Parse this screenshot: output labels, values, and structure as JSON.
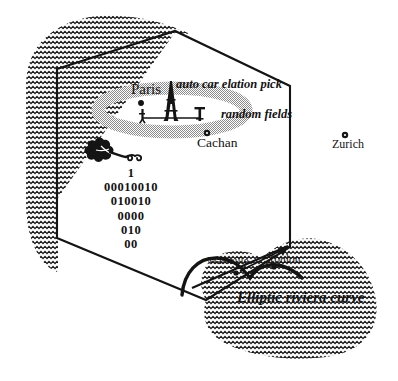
{
  "figure": {
    "kind": "hand-drawn-map-diagram",
    "background_color": "#ffffff",
    "ink_color": "#121212",
    "shade_color": "#9a9a9a"
  },
  "region": {
    "name": "hexagon-outline",
    "description": "France hexagon boundary"
  },
  "coastline": {
    "name": "wavy-hatched-coast",
    "pattern": "zigzag-wave-hatch"
  },
  "cities": [
    {
      "id": "paris",
      "label": "Paris",
      "marker": false
    },
    {
      "id": "cachan",
      "label": "Cachan",
      "marker": true
    },
    {
      "id": "zurich",
      "label": "Zurich",
      "marker": true
    },
    {
      "id": "marseille",
      "label": "Marseille",
      "marker": false
    },
    {
      "id": "toulon",
      "label": "Toulon",
      "marker": false
    }
  ],
  "annotations": {
    "auto_car": "auto  car elation pick",
    "random_fields": "random fields",
    "riviera": "Elliptic riviera curve"
  },
  "binary_block": {
    "lines": [
      "1",
      "00010010",
      "010010",
      "0000",
      "010",
      "00"
    ]
  },
  "icons": {
    "eiffel_tower": "eiffel-tower-icon",
    "leaf_flower": "leaf-flower-icon",
    "gray_ellipse": "shaded-ellipse",
    "city_dot": "city-dot-marker",
    "arrow": "arrow-pointer"
  },
  "colors": {
    "ink": "#121212",
    "shade": "#9a9a9a",
    "paper": "#ffffff"
  }
}
